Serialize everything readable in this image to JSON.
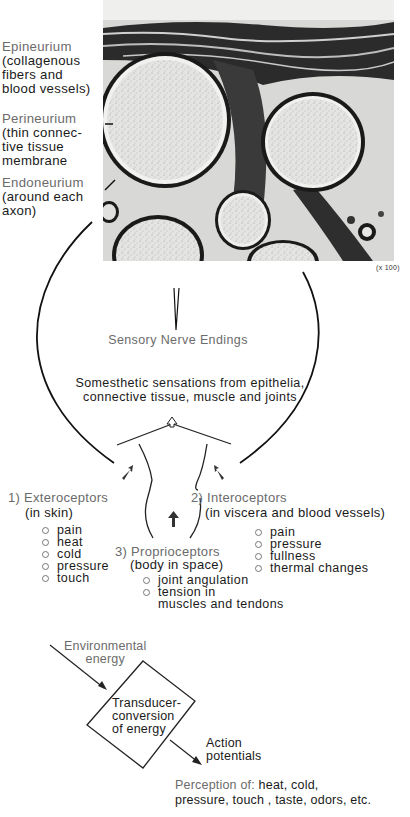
{
  "micrograph": {
    "alt": "Cross-section micrograph of peripheral nerve showing fascicles",
    "magnification": "(x 100)",
    "labels": [
      {
        "title": "Epineurium",
        "lines": [
          "(collagenous",
          "fibers and",
          "blood vessels)"
        ]
      },
      {
        "title": "Perineurium",
        "lines": [
          "(thin connec-",
          "tive  tissue",
          "membrane"
        ]
      },
      {
        "title": "Endoneurium",
        "lines": [
          "(around each",
          "axon)"
        ]
      }
    ]
  },
  "center": {
    "sensory_label": "Sensory Nerve Endings",
    "somesthetic_line1": "Somesthetic sensations from epithelia,",
    "somesthetic_line2": "connective tissue, muscle and joints"
  },
  "receptors": {
    "extero": {
      "title": "1) Exteroceptors",
      "subtitle": "(in skin)",
      "items": [
        "pain",
        "heat",
        "cold",
        "pressure",
        "touch"
      ]
    },
    "intero": {
      "title": "2) Interoceptors",
      "subtitle": "(in viscera and blood vessels)",
      "items": [
        "pain",
        "pressure",
        "fullness",
        "thermal changes"
      ]
    },
    "proprio": {
      "title": "3) Proprioceptors",
      "subtitle": "(body in space)",
      "items": [
        "joint angulation",
        "tension in",
        "muscles and tendons"
      ]
    }
  },
  "transducer": {
    "input_line1": "Environmental",
    "input_line2": "energy",
    "box_line1": "Transducer-",
    "box_line2": "conversion",
    "box_line3": "of energy",
    "output_line1": "Action",
    "output_line2": "potentials",
    "perception_prefix": "Perception of: ",
    "perception_line1": "heat, cold,",
    "perception_line2": "pressure, touch , taste, odors, etc."
  },
  "colors": {
    "ink": "#1a1a1a",
    "gray_label": "#6b6b6b",
    "background": "#ffffff"
  }
}
